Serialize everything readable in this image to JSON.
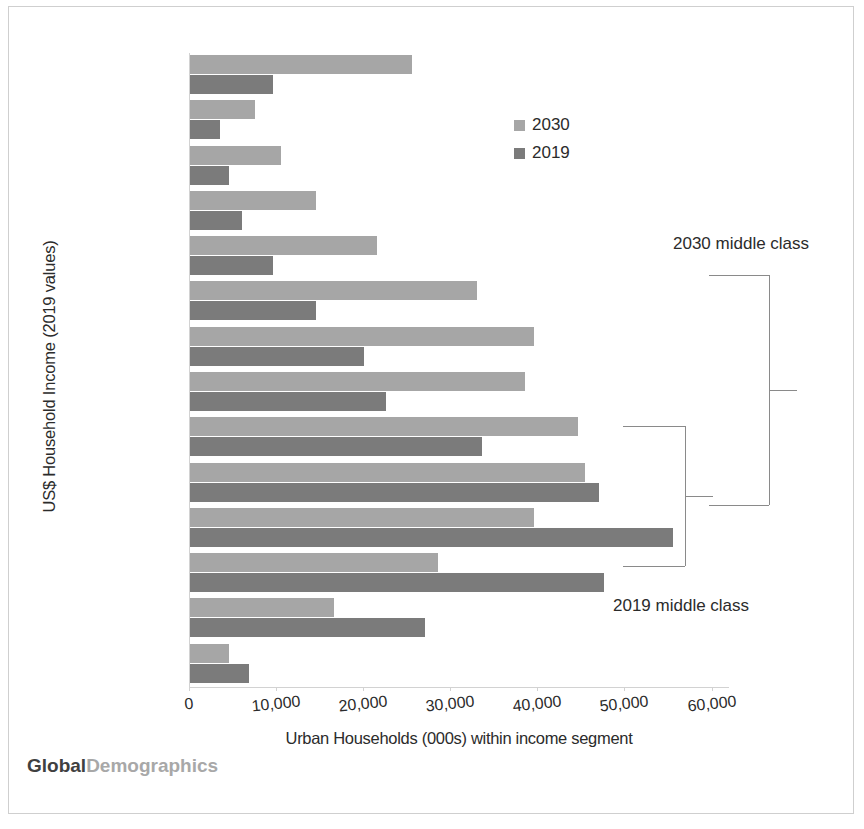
{
  "chart_data": {
    "type": "bar",
    "orientation": "horizontal",
    "title": "",
    "xlabel": "Urban Households (000s) within income segment",
    "ylabel": "US$ Household Income (2019 values)",
    "xlim": [
      0,
      62000
    ],
    "xticks": [
      0,
      10000,
      20000,
      30000,
      40000,
      50000,
      60000
    ],
    "xticklabels": [
      "0",
      "10,000",
      "20,000",
      "30,000",
      "40,000",
      "50,000",
      "60,000"
    ],
    "grid": false,
    "legend_position": "upper-center-right",
    "categories": [
      "Plus",
      "71000",
      "64000",
      "57000",
      "50000",
      "42000",
      "35000",
      "30000",
      "25000",
      "21000",
      "17000",
      "12000",
      "8000",
      "4000"
    ],
    "series": [
      {
        "name": "2030",
        "color": "#a6a6a6",
        "values": [
          25500,
          7500,
          10500,
          14500,
          21500,
          33000,
          39500,
          38500,
          44500,
          45300,
          39500,
          28500,
          16500,
          4500
        ]
      },
      {
        "name": "2019",
        "color": "#7b7b7b",
        "values": [
          9500,
          3500,
          4500,
          6000,
          9500,
          14500,
          20000,
          22500,
          33500,
          47000,
          55500,
          47500,
          27000,
          6800
        ]
      }
    ],
    "annotations": [
      {
        "id": "annot-2030-middle-class",
        "text": "2030 middle class",
        "brace_spans": [
          "25000",
          "50000"
        ]
      },
      {
        "id": "annot-2019-middle-class",
        "text": "2019 middle class",
        "brace_spans": [
          "17000",
          "25000"
        ]
      }
    ]
  },
  "legend": {
    "items": [
      {
        "label": "2030",
        "color": "#a6a6a6"
      },
      {
        "label": "2019",
        "color": "#7b7b7b"
      }
    ]
  },
  "annotations": {
    "middle_class_2030": "2030 middle class",
    "middle_class_2019": "2019 middle class"
  },
  "logo": {
    "primary": "Global",
    "secondary": "Demographics"
  }
}
